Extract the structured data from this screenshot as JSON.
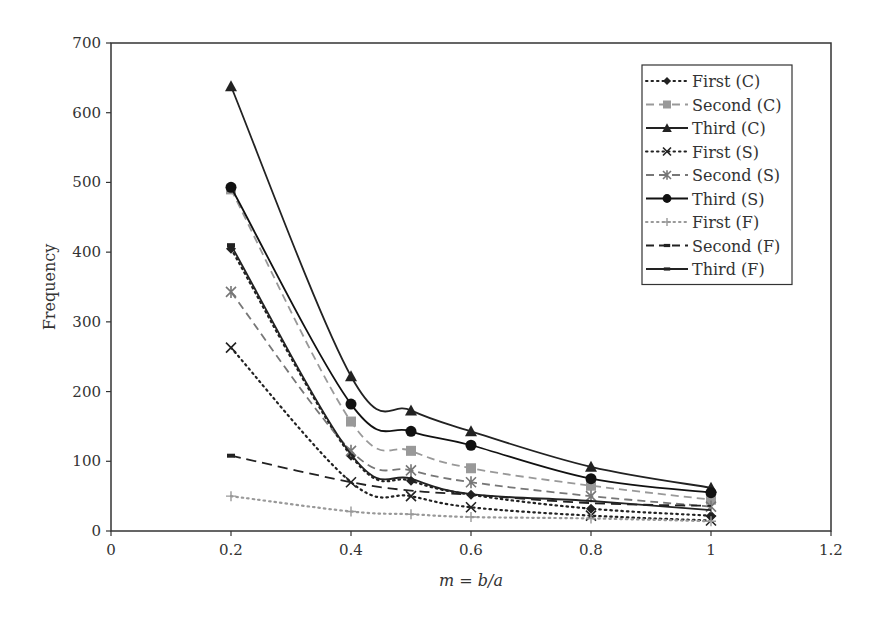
{
  "chart_data": {
    "type": "line",
    "title": "",
    "xlabel": "m = b/a",
    "ylabel": "Frequency",
    "xlim": [
      0,
      1.2
    ],
    "ylim": [
      0,
      700
    ],
    "x_ticks": [
      0,
      0.2,
      0.4,
      0.6,
      0.8,
      1,
      1.2
    ],
    "x_tick_labels": [
      "0",
      "0.2",
      "0.4",
      "0.6",
      "0.8",
      "1",
      "1.2"
    ],
    "y_ticks": [
      0,
      100,
      200,
      300,
      400,
      500,
      600,
      700
    ],
    "y_tick_labels": [
      "0",
      "100",
      "200",
      "300",
      "400",
      "500",
      "600",
      "700"
    ],
    "grid": false,
    "legend_position": "upper right (inside)",
    "x": [
      0.2,
      0.4,
      0.5,
      0.6,
      0.8,
      1.0
    ],
    "series": [
      {
        "name": "First (C)",
        "marker": "diamond",
        "line": "dotted",
        "color": "#222222",
        "values": [
          405,
          108,
          72,
          52,
          32,
          22
        ]
      },
      {
        "name": "Second (C)",
        "marker": "square",
        "line": "dashed",
        "color": "#999999",
        "values": [
          490,
          157,
          115,
          90,
          65,
          45
        ]
      },
      {
        "name": "Third (C)",
        "marker": "triangle",
        "line": "solid",
        "color": "#222222",
        "values": [
          638,
          222,
          173,
          143,
          92,
          62
        ]
      },
      {
        "name": "First (S)",
        "marker": "x",
        "line": "dotted",
        "color": "#222222",
        "values": [
          263,
          70,
          50,
          34,
          22,
          15
        ]
      },
      {
        "name": "Second (S)",
        "marker": "star",
        "line": "dashed",
        "color": "#777777",
        "values": [
          343,
          115,
          87,
          70,
          50,
          35
        ]
      },
      {
        "name": "Third (S)",
        "marker": "circle",
        "line": "solid",
        "color": "#111111",
        "values": [
          493,
          182,
          143,
          123,
          75,
          55
        ]
      },
      {
        "name": "First (F)",
        "marker": "plus",
        "line": "dotted",
        "color": "#999999",
        "values": [
          50,
          28,
          24,
          20,
          18,
          14
        ]
      },
      {
        "name": "Second (F)",
        "marker": "dash",
        "line": "long-dashed",
        "color": "#222222",
        "values": [
          108,
          70,
          58,
          52,
          40,
          36
        ]
      },
      {
        "name": "Third (F)",
        "marker": "dash",
        "line": "solid",
        "color": "#222222",
        "values": [
          410,
          110,
          75,
          53,
          43,
          30
        ]
      }
    ]
  }
}
